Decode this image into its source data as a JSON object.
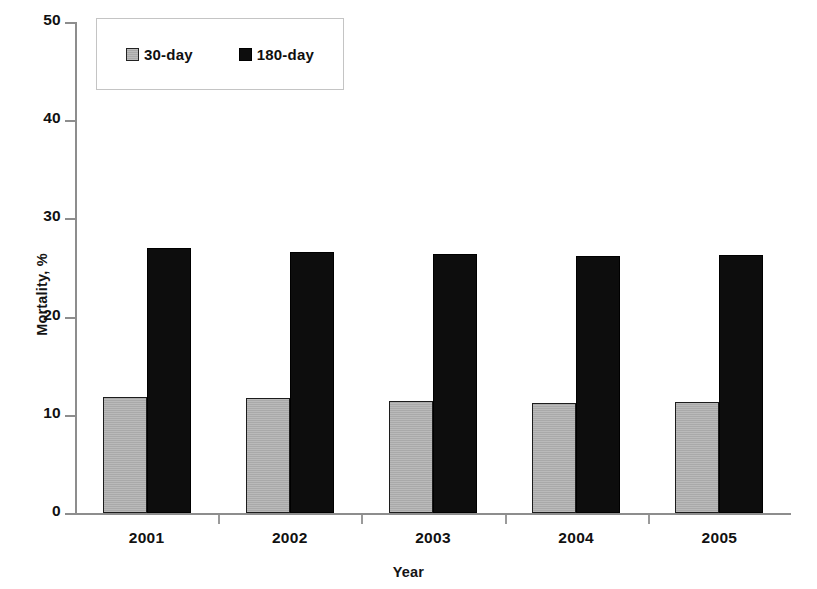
{
  "chart_data": {
    "type": "bar",
    "title": "",
    "xlabel": "Year",
    "ylabel": "Mortality, %",
    "categories": [
      "2001",
      "2002",
      "2003",
      "2004",
      "2005"
    ],
    "series": [
      {
        "name": "30-day",
        "color": "#b2b2b2",
        "values": [
          11.8,
          11.7,
          11.4,
          11.2,
          11.3
        ]
      },
      {
        "name": "180-day",
        "color": "#0d0d0d",
        "values": [
          27.0,
          26.6,
          26.4,
          26.2,
          26.3
        ]
      }
    ],
    "ylim": [
      0,
      50
    ],
    "yticks": [
      0,
      10,
      20,
      30,
      40,
      50
    ],
    "ytick_labels": [
      "0",
      "10",
      "20",
      "30",
      "40",
      "50"
    ],
    "grid": false,
    "legend_position": "upper-left-inside",
    "legend_entries": [
      "30-day",
      "180-day"
    ]
  },
  "axes": {
    "y_title": "Mortality, %",
    "x_title": "Year"
  },
  "legend": {
    "items": [
      {
        "label": "30-day"
      },
      {
        "label": "180-day"
      }
    ]
  }
}
